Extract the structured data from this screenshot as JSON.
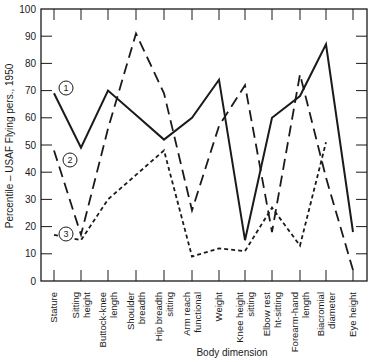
{
  "chart_data": {
    "type": "line",
    "title": "",
    "xlabel": "Body dimension",
    "ylabel": "Percentile – USAF Flying pers., 1950",
    "ylim": [
      0,
      100
    ],
    "yticks": [
      0,
      10,
      20,
      30,
      40,
      50,
      60,
      70,
      80,
      90,
      100
    ],
    "grid": false,
    "legend": "circled numbers placed next to line starts",
    "categories": [
      [
        "Stature"
      ],
      [
        "Sitting",
        "height"
      ],
      [
        "Buttock-knee",
        "length"
      ],
      [
        "Shoulder",
        "breadth"
      ],
      [
        "Hip breadth",
        "sitting"
      ],
      [
        "Arm reach",
        "functional"
      ],
      [
        "Weight"
      ],
      [
        "Knee height",
        "sitting"
      ],
      [
        "Elbow rest",
        "ht-sitting"
      ],
      [
        "Forearm-hand",
        "length"
      ],
      [
        "Biacromial",
        "diameter"
      ],
      [
        "Eye height"
      ]
    ],
    "series": [
      {
        "name": "1",
        "style": "solid",
        "values": [
          69,
          49,
          70,
          61,
          52,
          60,
          74,
          15,
          60,
          68,
          87,
          18
        ]
      },
      {
        "name": "2",
        "style": "long-dash",
        "values": [
          48,
          17,
          56,
          91,
          69,
          26,
          57,
          72,
          18,
          76,
          38,
          4
        ]
      },
      {
        "name": "3",
        "style": "short-dash",
        "values": [
          17,
          15,
          30,
          39,
          48,
          9,
          12,
          11,
          27,
          13,
          51,
          null
        ]
      }
    ]
  },
  "labels": {
    "marker_1": "1",
    "marker_2": "2",
    "marker_3": "3",
    "xlabel": "Body dimension",
    "ylabel": "Percentile – USAF Flying pers., 1950"
  }
}
